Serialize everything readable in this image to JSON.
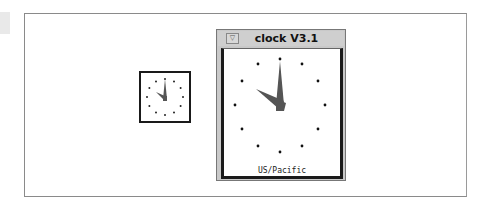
{
  "desktop": {
    "iconified_clock": {
      "hour": 10,
      "minute": 0
    }
  },
  "window": {
    "title": "clock V3.1",
    "menu_button_glyph": "▽",
    "timezone": "US/Pacific",
    "time": {
      "hour": 10,
      "minute": 0
    }
  },
  "colors": {
    "hand": "#555555",
    "tick": "#111111",
    "titlebar": "#cfcfcf"
  }
}
